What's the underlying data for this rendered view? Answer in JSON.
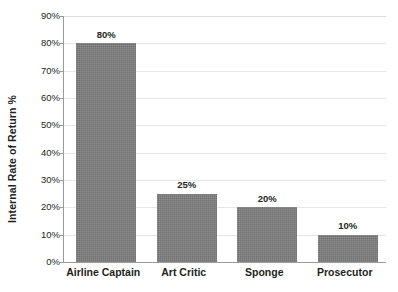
{
  "chart_data": {
    "type": "bar",
    "title": "",
    "subtitle": "",
    "xlabel": "",
    "ylabel": "Internal Rate of Return %",
    "categories": [
      "Airline Captain",
      "Art Critic",
      "Sponge",
      "Prosecutor"
    ],
    "values": [
      80,
      25,
      20,
      10
    ],
    "value_labels": [
      "80%",
      "25%",
      "20%",
      "10%"
    ],
    "ylim": [
      0,
      90
    ],
    "ytick_values": [
      0,
      10,
      20,
      30,
      40,
      50,
      60,
      70,
      80,
      90
    ],
    "ytick_labels": [
      "0%",
      "10%",
      "20%",
      "30%",
      "40%",
      "50%",
      "60%",
      "70%",
      "80%",
      "90%"
    ],
    "grid": true,
    "grid_axis": "y",
    "legend": false,
    "legend_position": "none",
    "series": [
      {
        "name": "Internal Rate of Return %",
        "values": [
          80,
          25,
          20,
          10
        ]
      }
    ],
    "colors": {
      "bar_fill": "#7d7d7d",
      "gridline": "#e6e6e6",
      "axis_line": "#9a9a9a",
      "text": "#231f20",
      "background": "#ffffff"
    }
  }
}
